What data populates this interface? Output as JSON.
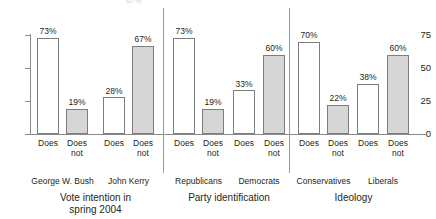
{
  "artifact": {
    "clipped_label": "67%"
  },
  "chart_data": {
    "type": "bar",
    "title": "",
    "xlabel": "",
    "ylabel": "",
    "ylim": [
      0,
      75
    ],
    "yticks": [
      "0",
      "25",
      "50",
      "75"
    ],
    "grid": false,
    "legend": "none",
    "categories": [
      "Does",
      "Does not"
    ],
    "series": [
      {
        "name": "Does",
        "color": "#ffffff"
      },
      {
        "name": "Does not",
        "color": "#d6d6d6"
      }
    ],
    "sections": [
      {
        "label_line1": "Vote intention in",
        "label_line2": "spring 2004",
        "groups": [
          {
            "name": "George W. Bush",
            "bars": [
              {
                "category": "Does",
                "line1": "Does",
                "line2": "",
                "value": 73,
                "label": "73%",
                "style": "open"
              },
              {
                "category": "Does not",
                "line1": "Does",
                "line2": "not",
                "value": 19,
                "label": "19%",
                "style": "filled"
              }
            ]
          },
          {
            "name": "John Kerry",
            "bars": [
              {
                "category": "Does",
                "line1": "Does",
                "line2": "",
                "value": 28,
                "label": "28%",
                "style": "open"
              },
              {
                "category": "Does not",
                "line1": "Does",
                "line2": "not",
                "value": 67,
                "label": "67%",
                "style": "filled"
              }
            ]
          }
        ]
      },
      {
        "label_line1": "Party identification",
        "label_line2": "",
        "groups": [
          {
            "name": "Republicans",
            "bars": [
              {
                "category": "Does",
                "line1": "Does",
                "line2": "",
                "value": 73,
                "label": "73%",
                "style": "open"
              },
              {
                "category": "Does not",
                "line1": "Does",
                "line2": "not",
                "value": 19,
                "label": "19%",
                "style": "filled"
              }
            ]
          },
          {
            "name": "Democrats",
            "bars": [
              {
                "category": "Does",
                "line1": "Does",
                "line2": "",
                "value": 33,
                "label": "33%",
                "style": "open"
              },
              {
                "category": "Does not",
                "line1": "Does",
                "line2": "not",
                "value": 60,
                "label": "60%",
                "style": "filled"
              }
            ]
          }
        ]
      },
      {
        "label_line1": "Ideology",
        "label_line2": "",
        "groups": [
          {
            "name": "Conservatives",
            "bars": [
              {
                "category": "Does",
                "line1": "Does",
                "line2": "",
                "value": 70,
                "label": "70%",
                "style": "open"
              },
              {
                "category": "Does not",
                "line1": "Does",
                "line2": "not",
                "value": 22,
                "label": "22%",
                "style": "filled"
              }
            ]
          },
          {
            "name": "Liberals",
            "bars": [
              {
                "category": "Does",
                "line1": "Does",
                "line2": "",
                "value": 38,
                "label": "38%",
                "style": "open"
              },
              {
                "category": "Does not",
                "line1": "Does",
                "line2": "not",
                "value": 60,
                "label": "60%",
                "style": "filled"
              }
            ]
          }
        ]
      }
    ]
  }
}
